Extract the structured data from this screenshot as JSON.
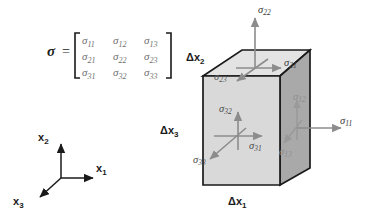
{
  "figure": {
    "colors": {
      "face_top": "#e3e3e3",
      "face_front": "#d9d9d9",
      "face_right": "#a9a9a9",
      "edge": "#1a1a1a",
      "arrow": "#8c8c8c",
      "arrow_faint": "#9a9a9a",
      "text": "#1a1a1a",
      "text_matrix": "#6f6f6f",
      "background": "#ffffff"
    }
  },
  "equation": {
    "symbol": "σ",
    "equals": "=",
    "bracket_left": "[",
    "bracket_right": "]",
    "matrix": [
      [
        {
          "base": "σ",
          "sub": "11"
        },
        {
          "base": "σ",
          "sub": "12"
        },
        {
          "base": "σ",
          "sub": "13"
        }
      ],
      [
        {
          "base": "σ",
          "sub": "21"
        },
        {
          "base": "σ",
          "sub": "22"
        },
        {
          "base": "σ",
          "sub": "23"
        }
      ],
      [
        {
          "base": "σ",
          "sub": "31"
        },
        {
          "base": "σ",
          "sub": "32"
        },
        {
          "base": "σ",
          "sub": "33"
        }
      ]
    ]
  },
  "axes_triad": {
    "labels": [
      {
        "id": "x2",
        "base": "x",
        "sub": "2",
        "direction": "up"
      },
      {
        "id": "x1",
        "base": "x",
        "sub": "1",
        "direction": "right"
      },
      {
        "id": "x3",
        "base": "x",
        "sub": "3",
        "direction": "down-left"
      }
    ]
  },
  "cube": {
    "dimension_labels": [
      {
        "id": "dx2",
        "base": "Δx",
        "sub": "2",
        "edge": "left-vertical"
      },
      {
        "id": "dx3",
        "base": "Δx",
        "sub": "3",
        "edge": "depth"
      },
      {
        "id": "dx1",
        "base": "Δx",
        "sub": "1",
        "edge": "bottom-front"
      }
    ],
    "stress_labels": [
      {
        "id": "s22",
        "base": "σ",
        "sub": "22",
        "face": "top",
        "direction": "up",
        "faint": false
      },
      {
        "id": "s21",
        "base": "σ",
        "sub": "21",
        "face": "top",
        "direction": "right",
        "faint": false
      },
      {
        "id": "s23",
        "base": "σ",
        "sub": "23",
        "face": "top",
        "direction": "down-left",
        "faint": false
      },
      {
        "id": "s32",
        "base": "σ",
        "sub": "32",
        "face": "front",
        "direction": "up",
        "faint": false
      },
      {
        "id": "s31",
        "base": "σ",
        "sub": "31",
        "face": "front",
        "direction": "right",
        "faint": false
      },
      {
        "id": "s33",
        "base": "σ",
        "sub": "33",
        "face": "front",
        "direction": "down-left",
        "faint": false
      },
      {
        "id": "s12",
        "base": "σ",
        "sub": "12",
        "face": "right",
        "direction": "up",
        "faint": true
      },
      {
        "id": "s11",
        "base": "σ",
        "sub": "11",
        "face": "right",
        "direction": "right",
        "faint": false
      },
      {
        "id": "s13",
        "base": "σ",
        "sub": "13",
        "face": "right",
        "direction": "down-left",
        "faint": true
      }
    ]
  }
}
